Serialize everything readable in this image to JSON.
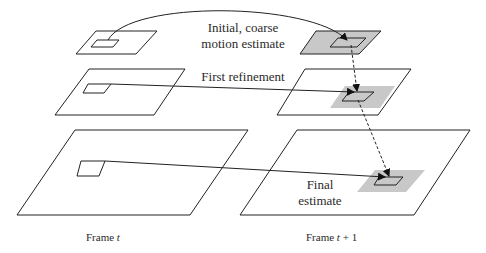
{
  "diagram": {
    "labels": {
      "initial_line1": "Initial, coarse",
      "initial_line2": "motion estimate",
      "first_refinement": "First refinement",
      "final_line1": "Final",
      "final_line2": "estimate",
      "frame_t_prefix": "Frame ",
      "frame_t_var": "t",
      "frame_t1_prefix": "Frame ",
      "frame_t1_var": "t",
      "frame_t1_suffix": " + 1"
    },
    "levels": [
      {
        "name": "coarse",
        "left_frame": "Frame t",
        "right_frame": "Frame t + 1",
        "right_shaded": true
      },
      {
        "name": "middle",
        "left_frame": "Frame t",
        "right_frame": "Frame t + 1",
        "search_region_shaded": true
      },
      {
        "name": "fine",
        "left_frame": "Frame t",
        "right_frame": "Frame t + 1",
        "search_region_shaded": true
      }
    ],
    "colors": {
      "line": "#222222",
      "shade": "#c8c8c8",
      "text": "#2a2a2a",
      "background": "#ffffff"
    }
  }
}
